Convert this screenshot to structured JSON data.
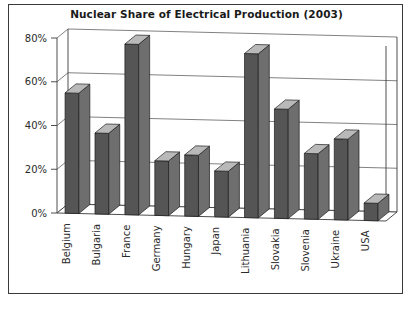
{
  "chart_data": {
    "type": "bar",
    "title": "Nuclear Share of Electrical Production (2003)",
    "xlabel": "",
    "ylabel": "",
    "categories": [
      "Belgium",
      "Bulgaria",
      "France",
      "Germany",
      "Hungary",
      "Japan",
      "Lithuania",
      "Slovakia",
      "Slovenia",
      "Ukraine",
      "USA"
    ],
    "values": [
      55,
      37,
      78,
      25,
      28,
      21,
      75,
      50,
      30,
      37,
      8
    ],
    "ylim": [
      0,
      80
    ],
    "yticks": [
      0,
      20,
      40,
      60,
      80
    ],
    "ytick_labels": [
      "0%",
      "20%",
      "40%",
      "60%",
      "80%"
    ],
    "grid": true,
    "legend": false,
    "style": "3d-column",
    "bar_color": "#555555",
    "bar_top_color": "#b9b9b9",
    "bar_side_color": "#6e6e6e",
    "background_color": "#ffffff",
    "border_color": "#3a3a3a"
  }
}
